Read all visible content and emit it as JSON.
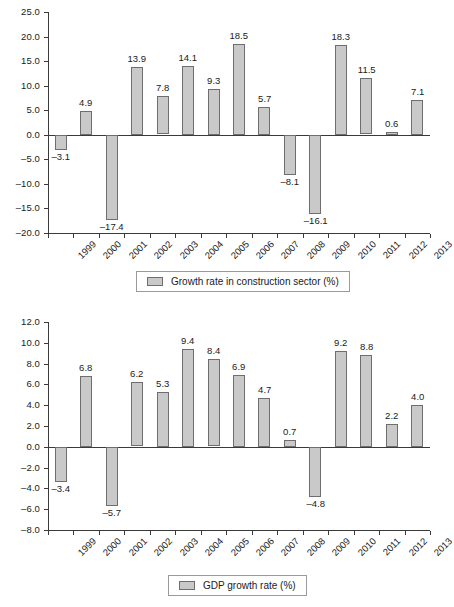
{
  "chart_data": [
    {
      "type": "bar",
      "id": "construction-growth",
      "title": "",
      "xlabel": "",
      "ylabel": "",
      "categories": [
        "1999",
        "2000",
        "2001",
        "2002",
        "2003",
        "2004",
        "2005",
        "2006",
        "2007",
        "2008",
        "2009",
        "2010",
        "2011",
        "2012",
        "2013"
      ],
      "values": [
        -3.1,
        4.9,
        -17.4,
        13.9,
        7.8,
        14.1,
        9.3,
        18.5,
        5.7,
        -8.1,
        -16.1,
        18.3,
        11.5,
        0.6,
        7.1
      ],
      "value_labels": [
        "–3.1",
        "4.9",
        "–17.4",
        "13.9",
        "7.8",
        "14.1",
        "9.3",
        "18.5",
        "5.7",
        "–8.1",
        "–16.1",
        "18.3",
        "11.5",
        "0.6",
        "7.1"
      ],
      "ylim": [
        -20.0,
        25.0
      ],
      "ytick_values": [
        25.0,
        20.0,
        15.0,
        10.0,
        5.0,
        0.0,
        -5.0,
        -10.0,
        -15.0,
        -20.0
      ],
      "ytick_labels": [
        "25.0",
        "20.0",
        "15.0",
        "10.0",
        "5.0",
        "0.0",
        "–5.0",
        "–10.0",
        "–15.0",
        "–20.0"
      ],
      "grid": false,
      "legend_position": "bottom",
      "legend": [
        "Growth rate in construction sector (%)"
      ],
      "series_color": "#c9c9c9",
      "series_border_color": "#6e6e6e"
    },
    {
      "type": "bar",
      "id": "gdp-growth",
      "title": "",
      "xlabel": "",
      "ylabel": "",
      "categories": [
        "1999",
        "2000",
        "2001",
        "2002",
        "2003",
        "2004",
        "2005",
        "2006",
        "2007",
        "2008",
        "2009",
        "2010",
        "2011",
        "2012",
        "2013"
      ],
      "values": [
        -3.4,
        6.8,
        -5.7,
        6.2,
        5.3,
        9.4,
        8.4,
        6.9,
        4.7,
        0.7,
        -4.8,
        9.2,
        8.8,
        2.2,
        4.0
      ],
      "value_labels": [
        "–3.4",
        "6.8",
        "–5.7",
        "6.2",
        "5.3",
        "9.4",
        "8.4",
        "6.9",
        "4.7",
        "0.7",
        "–4.8",
        "9.2",
        "8.8",
        "2.2",
        "4.0"
      ],
      "ylim": [
        -8.0,
        12.0
      ],
      "ytick_values": [
        12.0,
        10.0,
        8.0,
        6.0,
        4.0,
        2.0,
        0.0,
        -2.0,
        -4.0,
        -6.0,
        -8.0
      ],
      "ytick_labels": [
        "12.0",
        "10.0",
        "8.0",
        "6.0",
        "4.0",
        "2.0",
        "0.0",
        "–2.0",
        "–4.0",
        "–6.0",
        "–8.0"
      ],
      "grid": false,
      "legend_position": "bottom",
      "legend": [
        "GDP growth rate (%)"
      ],
      "series_color": "#c9c9c9",
      "series_border_color": "#6e6e6e"
    }
  ],
  "figure": {
    "background": "#ffffff",
    "axis_color": "#3a3a3a",
    "text_color": "#1a1a1a"
  }
}
